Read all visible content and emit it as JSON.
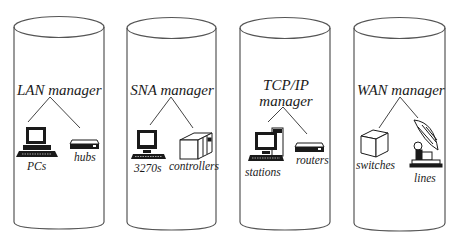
{
  "diagram": {
    "type": "network management domains",
    "colors": {
      "stroke": "#555555",
      "background": "#ffffff",
      "text": "#1a1a1a",
      "icon_fill": "#1a1a1a"
    },
    "domains": [
      {
        "manager": "LAN manager",
        "devices": [
          {
            "label": "PCs",
            "icon": "desktop-pc-icon"
          },
          {
            "label": "hubs",
            "icon": "hub-icon"
          }
        ]
      },
      {
        "manager": "SNA manager",
        "devices": [
          {
            "label": "3270s",
            "icon": "terminal-icon"
          },
          {
            "label": "controllers",
            "icon": "controller-box-icon"
          }
        ]
      },
      {
        "manager_line1": "TCP/IP",
        "manager_line2": "manager",
        "devices": [
          {
            "label": "stations",
            "icon": "workstation-tower-icon"
          },
          {
            "label": "routers",
            "icon": "router-icon"
          }
        ]
      },
      {
        "manager": "WAN manager",
        "devices": [
          {
            "label": "switches",
            "icon": "switch-cube-icon"
          },
          {
            "label": "lines",
            "icon": "satellite-dish-icon"
          }
        ]
      }
    ]
  }
}
